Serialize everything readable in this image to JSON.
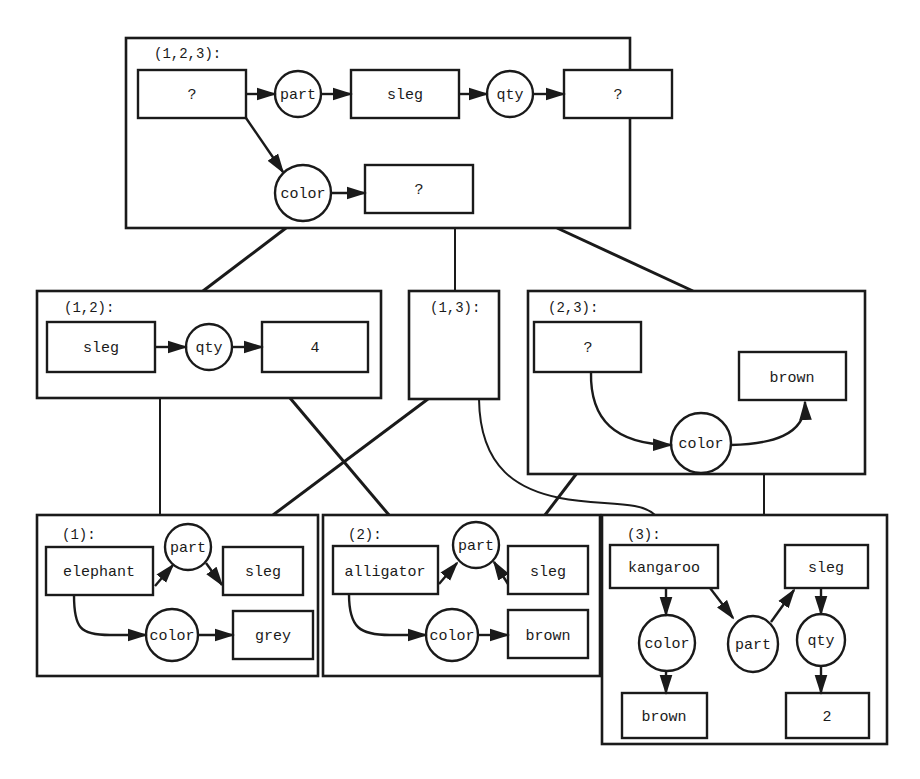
{
  "diagram": {
    "type": "generalization-lattice-of-conceptual-graphs",
    "frames": {
      "f123": {
        "label": "(1,2,3):",
        "nodes": {
          "q1": "?",
          "part": "part",
          "sleg": "sleg",
          "qty": "qty",
          "q2": "?",
          "color": "color",
          "q3": "?"
        }
      },
      "f12": {
        "label": "(1,2):",
        "nodes": {
          "sleg": "sleg",
          "qty": "qty",
          "four": "4"
        }
      },
      "f13": {
        "label": "(1,3):"
      },
      "f23": {
        "label": "(2,3):",
        "nodes": {
          "q": "?",
          "brown": "brown",
          "color": "color"
        }
      },
      "f1": {
        "label": "(1):",
        "nodes": {
          "elephant": "elephant",
          "part": "part",
          "sleg": "sleg",
          "color": "color",
          "grey": "grey"
        }
      },
      "f2": {
        "label": "(2):",
        "nodes": {
          "alligator": "alligator",
          "part": "part",
          "sleg": "sleg",
          "color": "color",
          "brown": "brown"
        }
      },
      "f3": {
        "label": "(3):",
        "nodes": {
          "kangaroo": "kangaroo",
          "sleg": "sleg",
          "color": "color",
          "part": "part",
          "qty": "qty",
          "brown": "brown",
          "two": "2"
        }
      }
    },
    "edges": [
      {
        "from": "(1,2,3)",
        "to": "(1,2)"
      },
      {
        "from": "(1,2,3)",
        "to": "(1,3)"
      },
      {
        "from": "(1,2,3)",
        "to": "(2,3)"
      },
      {
        "from": "(1,2)",
        "to": "(1)"
      },
      {
        "from": "(1,2)",
        "to": "(2)"
      },
      {
        "from": "(1,3)",
        "to": "(1)"
      },
      {
        "from": "(1,3)",
        "to": "(3)"
      },
      {
        "from": "(2,3)",
        "to": "(2)"
      },
      {
        "from": "(2,3)",
        "to": "(3)"
      }
    ]
  }
}
